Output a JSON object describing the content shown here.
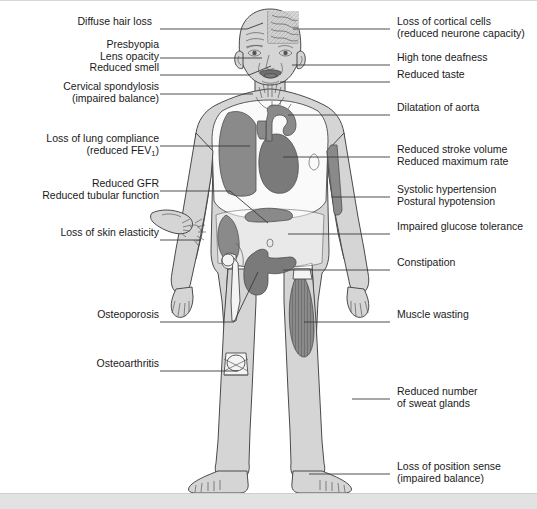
{
  "figure": {
    "colors": {
      "background": "#ffffff",
      "body_fill": "#d5d5d5",
      "cavity_fill": "#fafafa",
      "organ_fill": "#8a8a8a",
      "organ_dark": "#7a7a7a",
      "outline": "#4a4a4a",
      "leader_line": "#3a3a3a",
      "text": "#1a1a1a",
      "footer_bar": "#e2e2e2"
    }
  },
  "labels_left": [
    {
      "id": "diffuse-hair-loss",
      "lines": [
        "Diffuse hair loss"
      ],
      "text_x": 153,
      "text_y": 21,
      "line_x1": 160,
      "line_y1": 28,
      "line_x2": 247,
      "line_y2": 28,
      "elbow_x": 247,
      "elbow_y": 28,
      "tip_x": 263,
      "tip_y": 22
    },
    {
      "id": "presbyopia-lens-opacity",
      "lines": [
        "Presbyopia",
        "Lens opacity"
      ],
      "text_x": 146,
      "text_y": 44,
      "line_x1": 160,
      "line_y1": 57,
      "line_x2": 255,
      "line_y2": 57,
      "elbow_x": 255,
      "elbow_y": 57,
      "tip_x": 262,
      "tip_y": 57
    },
    {
      "id": "reduced-smell",
      "lines": [
        "Reduced smell"
      ],
      "text_x": 146,
      "text_y": 67,
      "line_x1": 160,
      "line_y1": 74,
      "line_x2": 249,
      "line_y2": 74,
      "elbow_x": 249,
      "elbow_y": 74,
      "tip_x": 271,
      "tip_y": 66
    },
    {
      "id": "cervical-spondylosis",
      "lines": [
        "Cervical spondylosis",
        "(impaired balance)"
      ],
      "text_x": 124,
      "text_y": 86,
      "line_x1": 160,
      "line_y1": 93,
      "line_x2": 253,
      "line_y2": 93,
      "elbow_x": 253,
      "elbow_y": 93,
      "tip_x": 253,
      "tip_y": 93
    },
    {
      "id": "loss-of-lung-compliance",
      "lines": [
        "Loss of lung compliance",
        "(reduced FEV₁)"
      ],
      "text_x": 119,
      "text_y": 138,
      "line_x1": 160,
      "line_y1": 145,
      "line_x2": 250,
      "line_y2": 145,
      "elbow_x": 250,
      "elbow_y": 145,
      "tip_x": 250,
      "tip_y": 145
    },
    {
      "id": "reduced-gfr",
      "lines": [
        "Reduced GFR",
        "Reduced tubular function"
      ],
      "text_x": 108,
      "text_y": 183,
      "line_x1": 160,
      "line_y1": 190,
      "line_x2": 230,
      "line_y2": 190,
      "elbow_x": 230,
      "elbow_y": 190,
      "tip_x": 268,
      "tip_y": 220
    },
    {
      "id": "loss-of-skin-elasticity",
      "lines": [
        "Loss of skin elasticity"
      ],
      "text_x": 122,
      "text_y": 232,
      "line_x1": 160,
      "line_y1": 239,
      "line_x2": 200,
      "line_y2": 239,
      "elbow_x": 200,
      "elbow_y": 239,
      "tip_x": 200,
      "tip_y": 239
    },
    {
      "id": "osteoporosis",
      "lines": [
        "Osteoporosis"
      ],
      "text_x": 143,
      "text_y": 314,
      "line_x1": 160,
      "line_y1": 321,
      "line_x2": 234,
      "line_y2": 321,
      "elbow_x": 234,
      "elbow_y": 321,
      "tip_x": 258,
      "tip_y": 272
    },
    {
      "id": "osteoarthritis",
      "lines": [
        "Osteoarthritis"
      ],
      "text_x": 140,
      "text_y": 363,
      "line_x1": 160,
      "line_y1": 370,
      "line_x2": 238,
      "line_y2": 370,
      "elbow_x": 238,
      "elbow_y": 370,
      "tip_x": 238,
      "tip_y": 370
    }
  ],
  "labels_right": [
    {
      "id": "loss-of-cortical-cells",
      "lines": [
        "Loss of cortical cells",
        "(reduced neurone capacity)"
      ],
      "text_x": 397,
      "text_y": 21,
      "line_x1": 390,
      "line_y1": 28,
      "line_x2": 293,
      "line_y2": 28,
      "tip_x": 293,
      "tip_y": 28
    },
    {
      "id": "high-tone-deafness",
      "lines": [
        "High tone deafness"
      ],
      "text_x": 397,
      "text_y": 57,
      "line_x1": 390,
      "line_y1": 64,
      "line_x2": 292,
      "line_y2": 64,
      "tip_x": 292,
      "tip_y": 64
    },
    {
      "id": "reduced-taste",
      "lines": [
        "Reduced taste"
      ],
      "text_x": 397,
      "text_y": 74,
      "line_x1": 390,
      "line_y1": 81,
      "line_x2": 280,
      "line_y2": 81,
      "tip_x": 280,
      "tip_y": 81
    },
    {
      "id": "dilatation-of-aorta",
      "lines": [
        "Dilatation of aorta"
      ],
      "text_x": 397,
      "text_y": 107,
      "line_x1": 390,
      "line_y1": 114,
      "line_x2": 288,
      "line_y2": 114,
      "tip_x": 288,
      "tip_y": 114
    },
    {
      "id": "reduced-stroke-volume",
      "lines": [
        "Reduced stroke volume",
        "Reduced maximum rate"
      ],
      "text_x": 397,
      "text_y": 149,
      "line_x1": 390,
      "line_y1": 156,
      "line_x2": 283,
      "line_y2": 156,
      "tip_x": 283,
      "tip_y": 156
    },
    {
      "id": "systolic-hypertension",
      "lines": [
        "Systolic hypertension",
        "Postural hypotension"
      ],
      "text_x": 397,
      "text_y": 189,
      "line_x1": 390,
      "line_y1": 196,
      "line_x2": 332,
      "line_y2": 196,
      "tip_x": 332,
      "tip_y": 196
    },
    {
      "id": "impaired-glucose-tolerance",
      "lines": [
        "Impaired glucose tolerance"
      ],
      "text_x": 397,
      "text_y": 226,
      "line_x1": 390,
      "line_y1": 233,
      "line_x2": 288,
      "line_y2": 233,
      "tip_x": 288,
      "tip_y": 233
    },
    {
      "id": "constipation",
      "lines": [
        "Constipation"
      ],
      "text_x": 397,
      "text_y": 262,
      "line_x1": 390,
      "line_y1": 269,
      "line_x2": 283,
      "line_y2": 269,
      "tip_x": 283,
      "tip_y": 269
    },
    {
      "id": "muscle-wasting",
      "lines": [
        "Muscle wasting"
      ],
      "text_x": 397,
      "text_y": 314,
      "line_x1": 390,
      "line_y1": 321,
      "line_x2": 304,
      "line_y2": 321,
      "tip_x": 304,
      "tip_y": 321
    },
    {
      "id": "reduced-sweat-glands",
      "lines": [
        "Reduced number",
        "of sweat glands"
      ],
      "text_x": 397,
      "text_y": 391,
      "line_x1": 390,
      "line_y1": 398,
      "line_x2": 352,
      "line_y2": 398,
      "tip_x": 352,
      "tip_y": 398
    },
    {
      "id": "loss-of-position-sense",
      "lines": [
        "Loss of position sense",
        "(impaired balance)"
      ],
      "text_x": 397,
      "text_y": 466,
      "line_x1": 390,
      "line_y1": 473,
      "line_x2": 309,
      "line_y2": 473,
      "tip_x": 309,
      "tip_y": 473
    }
  ],
  "anatomy": {
    "organs": [
      {
        "id": "brain-cortex-cutaway",
        "name": "Skull cut-away showing cortex"
      },
      {
        "id": "eye-left",
        "name": "Left eye (lens opacity)"
      },
      {
        "id": "eye-right",
        "name": "Right eye"
      },
      {
        "id": "ear-left",
        "name": "Left ear (high tone deafness)"
      },
      {
        "id": "ear-right",
        "name": "Right ear"
      },
      {
        "id": "mouth-tongue",
        "name": "Open mouth with tongue (reduced taste)"
      },
      {
        "id": "lung",
        "name": "Lung (reduced compliance)"
      },
      {
        "id": "heart",
        "name": "Heart (reduced stroke volume)"
      },
      {
        "id": "aortic-arch",
        "name": "Aortic arch (dilatation of aorta)"
      },
      {
        "id": "brachial-artery",
        "name": "Upper arm artery (systolic hypertension)"
      },
      {
        "id": "kidney",
        "name": "Kidney (reduced GFR)"
      },
      {
        "id": "pancreas",
        "name": "Pancreas (impaired glucose tolerance)"
      },
      {
        "id": "colon",
        "name": "Colon (constipation)"
      },
      {
        "id": "hip-femur",
        "name": "Hip joint and femur (osteoporosis)"
      },
      {
        "id": "knee-joint",
        "name": "Knee joint (osteoarthritis)"
      },
      {
        "id": "thigh-muscle",
        "name": "Thigh muscle (muscle wasting)"
      },
      {
        "id": "skin-pinch-hand",
        "name": "Hand pinching forearm skin (loss of skin elasticity)"
      }
    ]
  },
  "footer": {
    "y": 492,
    "height": 17
  }
}
